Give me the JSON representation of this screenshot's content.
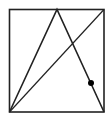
{
  "diagram": {
    "type": "geometry",
    "rectangle": {
      "x1": 9.5,
      "y1": 9.5,
      "x2": 104,
      "y2": 112
    },
    "triangle": [
      [
        9.5,
        112
      ],
      [
        57,
        9.5
      ],
      [
        104,
        112
      ]
    ],
    "diagonal": [
      [
        9.5,
        112
      ],
      [
        104,
        9.5
      ]
    ],
    "point": {
      "x": 91,
      "y": 83
    },
    "stroke_color": "#222222",
    "point_color": "#000000"
  }
}
